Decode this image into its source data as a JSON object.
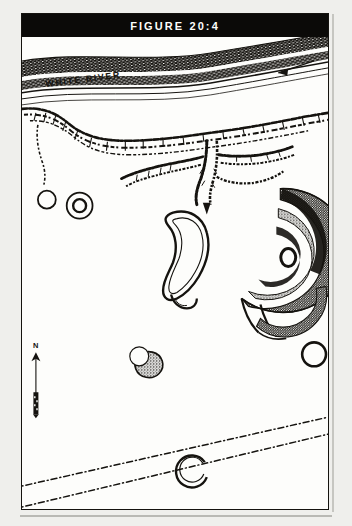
{
  "figure": {
    "title": "FIGURE 20:4",
    "caption_bar_color": "#0b0a08",
    "ink_color": "#15130f",
    "paper_color": "#fdfdfb"
  },
  "map": {
    "labels": {
      "river": "WHITE RIVER",
      "north": "N"
    },
    "features": [
      {
        "name": "white-river",
        "type": "river",
        "note": "double-banked stippled channel across top of plate, flowing to the west"
      },
      {
        "name": "river-flow-arrow",
        "type": "arrow",
        "direction": "west",
        "note": "downstream flow indicator inside channel at upper right"
      },
      {
        "name": "ravine-network",
        "type": "ravine",
        "note": "branching stippled gully edges below the river terrace"
      },
      {
        "name": "great-circle-earthwork",
        "type": "earthwork-enclosure",
        "shape": "circular",
        "rings": 3,
        "gateway": "south",
        "note": "large concentric embankment with central oval mound"
      },
      {
        "name": "central-mound",
        "type": "mound",
        "shape": "oval"
      },
      {
        "name": "oval-enclosure",
        "type": "earthwork-enclosure",
        "shape": "pear-oval"
      },
      {
        "name": "small-circle-west",
        "type": "earthwork-enclosure",
        "shape": "circular"
      },
      {
        "name": "double-ring-circle",
        "type": "earthwork-enclosure",
        "shape": "circular",
        "rings": 2
      },
      {
        "name": "small-circle-center",
        "type": "earthwork-enclosure",
        "shape": "circular"
      },
      {
        "name": "small-circle-east",
        "type": "earthwork-enclosure",
        "shape": "circular"
      },
      {
        "name": "gapped-circle-south",
        "type": "earthwork-enclosure",
        "shape": "circular",
        "gateway": "northeast"
      },
      {
        "name": "section-lines",
        "type": "boundary",
        "style": "dash-dot",
        "count": 2,
        "note": "two parallel surveyed lines crossing the lower plate"
      }
    ],
    "north_arrow": {
      "label": "N",
      "points": "up"
    },
    "scale_bar": {
      "label": "",
      "note": "small graphic scale below north arrow"
    }
  }
}
